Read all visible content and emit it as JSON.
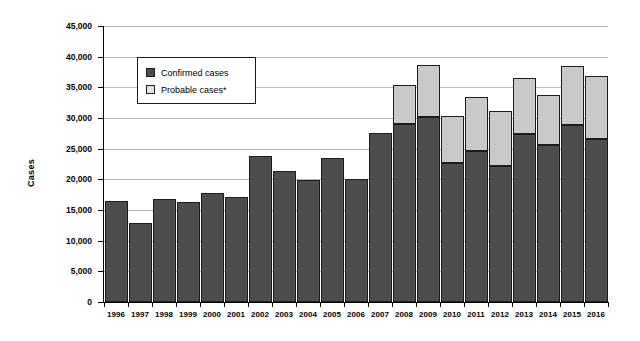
{
  "chart_data": {
    "type": "bar",
    "subtype": "stacked-bar",
    "title": "",
    "xlabel": "",
    "ylabel": "Cases",
    "ylim": [
      0,
      45000
    ],
    "ytick_values": [
      0,
      5000,
      10000,
      15000,
      20000,
      25000,
      30000,
      35000,
      40000,
      45000
    ],
    "ytick_labels": [
      "0",
      "5,000",
      "10,000",
      "15,000",
      "20,000",
      "25,000",
      "30,000",
      "35,000",
      "40,000",
      "45,000"
    ],
    "grid": true,
    "legend_position": "upper-left-inside",
    "categories": [
      "1996",
      "1997",
      "1998",
      "1999",
      "2000",
      "2001",
      "2002",
      "2003",
      "2004",
      "2005",
      "2006",
      "2007",
      "2008",
      "2009",
      "2010",
      "2011",
      "2012",
      "2013",
      "2014",
      "2015",
      "2016"
    ],
    "series": [
      {
        "name": "Confirmed cases",
        "color": "#4d4d4d",
        "values": [
          16500,
          12900,
          16800,
          16300,
          17800,
          17100,
          23800,
          21300,
          19900,
          23400,
          20000,
          27600,
          29100,
          30200,
          22700,
          24600,
          22200,
          27400,
          25600,
          28800,
          26500
        ]
      },
      {
        "name": "Probable cases*",
        "color": "#c9c9c9",
        "values": [
          0,
          0,
          0,
          0,
          0,
          0,
          0,
          0,
          0,
          0,
          0,
          0,
          6300,
          8500,
          7700,
          8800,
          8900,
          9200,
          8200,
          9700,
          10300
        ]
      }
    ],
    "totals": [
      16500,
      12900,
      16800,
      16300,
      17800,
      17100,
      23800,
      21300,
      19900,
      23400,
      20000,
      27600,
      35400,
      38700,
      30400,
      33400,
      31100,
      36600,
      33800,
      38500,
      36800
    ]
  },
  "legend": {
    "items": [
      {
        "label": "Confirmed cases",
        "swatch": "confirmed"
      },
      {
        "label": "Probable cases*",
        "swatch": "probable"
      }
    ]
  },
  "axis": {
    "y_title": "Cases"
  },
  "colors": {
    "confirmed": "#4d4d4d",
    "probable": "#c9c9c9",
    "gridline": "#b9b9b9",
    "axis": "#000000",
    "background": "#ffffff"
  }
}
